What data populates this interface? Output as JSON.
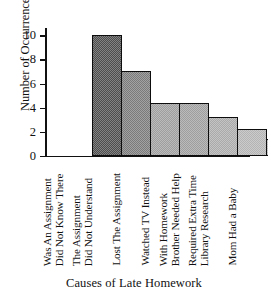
{
  "chart_data": {
    "type": "bar",
    "title": "",
    "ylabel": "Number of Occurrences (Period: 7 Weeks)",
    "xlabel": "Causes of Late Homework",
    "ylim": [
      0,
      10.6
    ],
    "yticks": [
      0,
      2,
      4,
      6,
      8,
      10
    ],
    "ytick_labels": [
      "0",
      "2",
      "4",
      "6",
      "8",
      "10"
    ],
    "grid": false,
    "legend": null,
    "orientation": "vertical",
    "bar_gap": 0,
    "categories": [
      "Did Not Know There Was An Assignment",
      "Did Not Understand The Assignment",
      "Lost The Assignment",
      "Watched TV Instead",
      "Brother Needed Help With Homework",
      "Library Research Required Extra Time",
      "Mom Had a Baby"
    ],
    "category_lines": [
      [
        "Did Not Know There",
        "Was An Assignment"
      ],
      [
        "Did Not Understand",
        "The Assignment"
      ],
      [
        "Lost The Assignment"
      ],
      [
        "Watched TV Instead"
      ],
      [
        "Brother Needed Help",
        "With Homework"
      ],
      [
        "Library Research",
        "Required Extra Time"
      ],
      [
        "Mom Had a Baby"
      ]
    ],
    "values": [
      10,
      7,
      4.4,
      4.4,
      3.2,
      2.2,
      1.4
    ],
    "bar_colors": [
      "#4d4d4d",
      "#7a7a7a",
      "#9e9e9e",
      "#9e9e9e",
      "#aaaaaa",
      "#b4b4b4",
      "#bdbdbd"
    ],
    "bar_edge_color": "#0d0d0d",
    "axis_color": "#111111",
    "background_color": "#ffffff"
  }
}
